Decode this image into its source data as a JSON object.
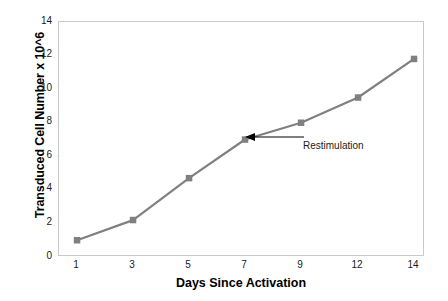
{
  "chart_data": {
    "type": "line",
    "title": "",
    "xlabel": "Days Since Activation",
    "ylabel": "Transduced Cell Number x 10^6",
    "categories": [
      "1",
      "3",
      "5",
      "7",
      "9",
      "12",
      "14"
    ],
    "values": [
      1.0,
      2.2,
      4.7,
      7.0,
      8.0,
      9.5,
      11.8
    ],
    "series": [
      {
        "name": "Transduced Cell Number",
        "values": [
          1.0,
          2.2,
          4.7,
          7.0,
          8.0,
          9.5,
          11.8
        ],
        "color": "#808080",
        "marker": "square"
      }
    ],
    "ylim": [
      0,
      14
    ],
    "yticks": [
      "0",
      "2",
      "4",
      "6",
      "8",
      "10",
      "12",
      "14"
    ],
    "xticks": [
      "1",
      "3",
      "5",
      "7",
      "9",
      "12",
      "14"
    ],
    "grid": false,
    "legend": "none",
    "annotations": [
      {
        "text": "Restimulation",
        "points_to_category": "7",
        "points_to_value": 7.0,
        "arrow": "left"
      }
    ]
  },
  "axes": {
    "y_title": "Transduced Cell Number x 10^6",
    "x_title": "Days Since Activation"
  },
  "colors": {
    "line": "#808080",
    "marker": "#808080",
    "frame": "#c9c9c9",
    "text": "#1a1a1a",
    "annotation": "#000000",
    "background": "#ffffff"
  }
}
